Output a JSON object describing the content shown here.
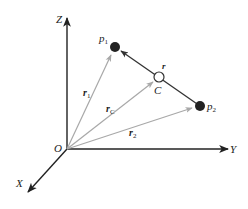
{
  "diagram": {
    "title": "",
    "axes": {
      "z_label": "Z",
      "y_label": "Y",
      "x_label": "X",
      "origin_label": "O"
    },
    "points": {
      "p1": {
        "label": "p",
        "subscript": "1"
      },
      "p2": {
        "label": "p",
        "subscript": "2"
      },
      "c": {
        "label": "C"
      }
    },
    "vectors": {
      "r1": {
        "label": "r",
        "subscript": "1"
      },
      "rc": {
        "label": "r",
        "subscript": "C"
      },
      "r2": {
        "label": "r",
        "subscript": "2"
      },
      "r": {
        "label": "r"
      }
    },
    "colors": {
      "axis": "#222222",
      "position_vector": "#a8a8a8",
      "relative_vector": "#333333",
      "point_fill": "#222222",
      "center_fill": "#ffffff"
    }
  }
}
